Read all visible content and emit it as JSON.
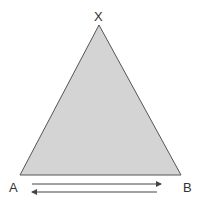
{
  "diagram": {
    "labels": {
      "apex": "X",
      "left": "A",
      "right": "B"
    },
    "colors": {
      "fill": "#d4d4d4",
      "stroke": "#555555",
      "arrow": "#444444"
    },
    "arrows": [
      {
        "from": "A",
        "to": "B",
        "direction": "right"
      },
      {
        "from": "B",
        "to": "A",
        "direction": "left"
      }
    ]
  }
}
